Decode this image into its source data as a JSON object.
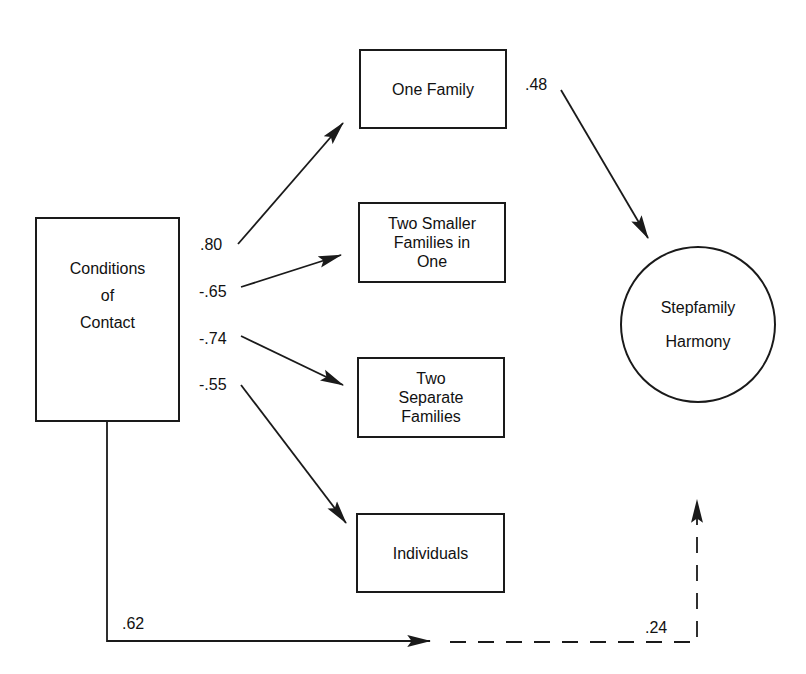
{
  "diagram": {
    "type": "path-model",
    "nodes": {
      "conditions": {
        "lines": [
          "Conditions",
          "of",
          "Contact"
        ],
        "shape": "rectangle"
      },
      "one_family": {
        "lines": [
          "One Family"
        ],
        "shape": "rectangle"
      },
      "two_smaller": {
        "lines": [
          "Two Smaller",
          "Families in",
          "One"
        ],
        "shape": "rectangle"
      },
      "two_separate": {
        "lines": [
          "Two",
          "Separate",
          "Families"
        ],
        "shape": "rectangle"
      },
      "individuals": {
        "lines": [
          "Individuals"
        ],
        "shape": "rectangle"
      },
      "harmony": {
        "lines": [
          "Stepfamily",
          "Harmony"
        ],
        "shape": "circle"
      }
    },
    "edges": [
      {
        "from": "Conditions of Contact",
        "to": "One Family",
        "coefficient": ".80",
        "style": "solid"
      },
      {
        "from": "Conditions of Contact",
        "to": "Two Smaller Families in One",
        "coefficient": "-.65",
        "style": "solid"
      },
      {
        "from": "Conditions of Contact",
        "to": "Two Separate Families",
        "coefficient": "-.74",
        "style": "solid"
      },
      {
        "from": "Conditions of Contact",
        "to": "Individuals",
        "coefficient": "-.55",
        "style": "solid"
      },
      {
        "from": "One Family",
        "to": "Stepfamily Harmony",
        "coefficient": ".48",
        "style": "solid"
      },
      {
        "from": "Conditions of Contact",
        "to": "Stepfamily Harmony",
        "coefficient": ".62",
        "style": "solid (total effect)"
      },
      {
        "from": "Conditions of Contact",
        "to": "Stepfamily Harmony",
        "coefficient": ".24",
        "style": "dashed (direct effect)"
      }
    ],
    "colors": {
      "stroke": "#1a1a1a",
      "background": "#ffffff",
      "text": "#111111"
    }
  }
}
